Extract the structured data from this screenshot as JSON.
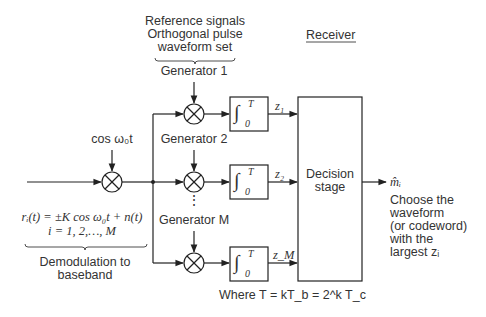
{
  "diagram": {
    "title": "Receiver",
    "reference": {
      "line1": "Reference signals",
      "line2": "Orthogonal pulse",
      "line3": "waveform set"
    },
    "generators": [
      "Generator 1",
      "Generator 2",
      "Generator M"
    ],
    "carrier_label": "cos ω₀t",
    "input_signal": {
      "line1": "rᵢ(t) = ±K cos ω₀t + n(t)",
      "line2": "i = 1, 2,…, M"
    },
    "demod_label": {
      "line1": "Demodulation to",
      "line2": "baseband"
    },
    "integrator": {
      "upper": "T",
      "lower": "0",
      "symbol": "∫"
    },
    "integrator_outputs": [
      "z₁",
      "z₂",
      "z_M"
    ],
    "decision": {
      "line1": "Decision",
      "line2": "stage"
    },
    "output_label": "m̂ᵢ",
    "output_desc": [
      "Choose the",
      "waveform",
      "(or codeword)",
      "with the",
      "largest zᵢ"
    ],
    "footnote": "Where T = kT_b = 2^k T_c",
    "dots": "⋮"
  }
}
